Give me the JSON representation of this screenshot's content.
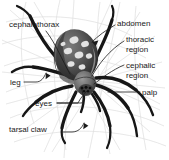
{
  "diagram": {
    "background": "#ffffff",
    "ink_color": "#1a1a1a",
    "web_color": "#d8d8d8",
    "width": 169,
    "height": 160
  },
  "labels": {
    "cephalothorax": "cephalothorax",
    "abdomen": "abdomen",
    "thoracic_line1": "thoracic",
    "thoracic_line2": "region",
    "cephalic_line1": "cephalic",
    "cephalic_line2": "region",
    "palp": "palp",
    "leg": "leg",
    "eyes": "eyes",
    "tarsal_claw": "tarsal claw"
  },
  "parts": [
    {
      "id": "cephalothorax",
      "label": "cephalothorax",
      "side": "left",
      "leader": "curve"
    },
    {
      "id": "abdomen",
      "label": "abdomen",
      "side": "right",
      "leader": "arrow"
    },
    {
      "id": "thoracic",
      "label": "thoracic region",
      "side": "right",
      "leader": "line"
    },
    {
      "id": "cephalic",
      "label": "cephalic region",
      "side": "right",
      "leader": "line"
    },
    {
      "id": "palp",
      "label": "palp",
      "side": "right",
      "leader": "line"
    },
    {
      "id": "leg",
      "label": "leg",
      "side": "left",
      "leader": "arrow"
    },
    {
      "id": "eyes",
      "label": "eyes",
      "side": "left",
      "leader": "line"
    },
    {
      "id": "tarsal-claw",
      "label": "tarsal claw",
      "side": "left",
      "leader": "arrow"
    }
  ]
}
